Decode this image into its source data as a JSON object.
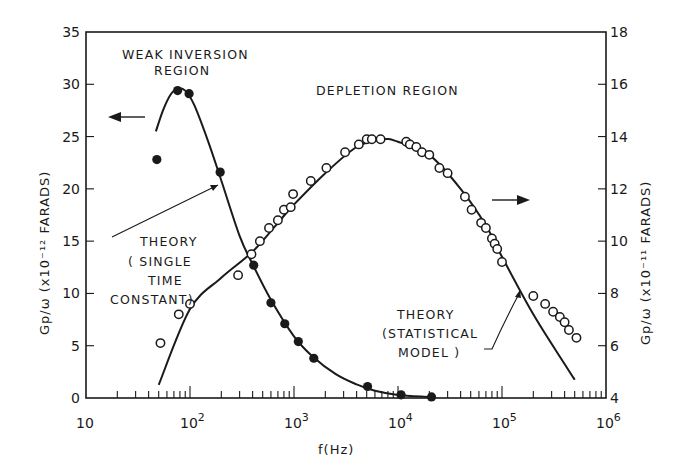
{
  "chart_data": {
    "type": "scatter",
    "title": "",
    "xlabel": "f(Hz)",
    "xscale": "log",
    "xlim": [
      10,
      1000000
    ],
    "x_tick_labels": [
      "10",
      "10^2",
      "10^3",
      "10^4",
      "10^5",
      "10^6"
    ],
    "ylabel_left": "Gp/ω (x10^-12 FARADS)",
    "ylim_left": [
      0,
      35
    ],
    "y_tick_labels_left": [
      "0",
      "5",
      "10",
      "15",
      "20",
      "25",
      "30",
      "35"
    ],
    "ylabel_right": "Gp/ω (x10^-11 FARADS)",
    "ylim_right": [
      4,
      18
    ],
    "y_tick_labels_right": [
      "4",
      "6",
      "8",
      "10",
      "12",
      "14",
      "16",
      "18"
    ],
    "grid": false,
    "legend": null,
    "annotations": [
      {
        "text": "WEAK INVERSION REGION",
        "refers_to": "filled-series"
      },
      {
        "text": "DEPLETION REGION",
        "refers_to": "open-series"
      },
      {
        "text": "THEORY (SINGLE TIME CONSTANT)",
        "refers_to": "weak-inversion theory curve"
      },
      {
        "text": "THEORY (STATISTICAL MODEL)",
        "refers_to": "depletion theory curve"
      },
      {
        "text": "left arrow",
        "meaning": "filled points use left axis"
      },
      {
        "text": "right arrow",
        "meaning": "open points use right axis"
      }
    ],
    "series": [
      {
        "name": "Weak inversion region (measured)",
        "marker": "filled-circle",
        "axis": "left",
        "x": [
          48,
          76,
          98,
          195,
          410,
          600,
          815,
          1100,
          1550,
          5100,
          10700,
          21000
        ],
        "y": [
          22.8,
          29.4,
          29.1,
          21.6,
          12.7,
          9.1,
          7.1,
          5.4,
          3.8,
          1.1,
          0.3,
          0.1
        ]
      },
      {
        "name": "Theory (single time constant)",
        "marker": "line",
        "axis": "left",
        "x": [
          47,
          55,
          65,
          76,
          90,
          110,
          150,
          200,
          300,
          400,
          600,
          1000,
          1500,
          2500,
          4000,
          6000,
          10000,
          20000
        ],
        "y": [
          25.5,
          27.5,
          29.0,
          29.6,
          29.4,
          28.0,
          24.5,
          20.8,
          15.5,
          12.8,
          9.4,
          5.9,
          4.0,
          2.3,
          1.3,
          0.7,
          0.3,
          0.1
        ]
      },
      {
        "name": "Depletion region (measured)",
        "marker": "open-circle",
        "axis": "right",
        "x": [
          52,
          78,
          100,
          290,
          390,
          470,
          575,
          700,
          800,
          930,
          980,
          1450,
          2050,
          3100,
          4200,
          5000,
          5600,
          6800,
          12000,
          13000,
          15000,
          17000,
          20000,
          25000,
          30000,
          44000,
          51000,
          63000,
          70000,
          80000,
          85000,
          90000,
          100000,
          200000,
          260000,
          310000,
          360000,
          400000,
          440000,
          520000
        ],
        "y": [
          6.1,
          7.2,
          7.6,
          8.7,
          9.5,
          10.0,
          10.5,
          10.8,
          11.2,
          11.3,
          11.8,
          12.3,
          12.8,
          13.4,
          13.7,
          13.9,
          13.9,
          13.9,
          13.8,
          13.7,
          13.6,
          13.4,
          13.3,
          12.8,
          12.6,
          11.7,
          11.2,
          10.7,
          10.5,
          10.1,
          9.9,
          9.7,
          9.2,
          7.9,
          7.6,
          7.3,
          7.1,
          6.9,
          6.6,
          6.3
        ]
      },
      {
        "name": "Theory (statistical model)",
        "marker": "line",
        "axis": "right",
        "x": [
          50,
          100,
          200,
          400,
          700,
          1000,
          2000,
          4000,
          7000,
          10000,
          20000,
          40000,
          70000,
          100000,
          200000,
          400000,
          500000
        ],
        "y": [
          4.5,
          7.4,
          8.6,
          9.6,
          10.7,
          11.4,
          12.6,
          13.6,
          13.9,
          13.8,
          13.3,
          12.0,
          10.6,
          9.4,
          7.2,
          5.3,
          4.7
        ]
      }
    ]
  },
  "labels": {
    "weak_inversion_line1": "WEAK INVERSION",
    "weak_inversion_line2": "REGION",
    "depletion": "DEPLETION REGION",
    "theory_single_1": "THEORY",
    "theory_single_2": "( SINGLE",
    "theory_single_3": "TIME",
    "theory_single_4": "CONSTANT)",
    "theory_stat_1": "THEORY",
    "theory_stat_2": "(STATISTICAL",
    "theory_stat_3": "MODEL )",
    "x_axis_title": "f(Hz)",
    "y_left_title": "Gp/ω (x10⁻¹² FARADS)",
    "y_right_title": "Gp/ω (x10⁻¹¹ FARADS)"
  }
}
